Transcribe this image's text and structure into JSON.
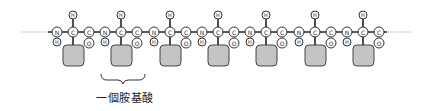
{
  "diagram": {
    "residue_count": 7,
    "atoms": {
      "nitrogen": "N",
      "alpha_carbon": "C",
      "carbonyl_carbon": "C",
      "oxygen": "O",
      "hydrogen": "H"
    },
    "residue_n_x": [
      57,
      105,
      154,
      202,
      250,
      299,
      347
    ],
    "backbone_y": 32,
    "side_chain_color": "#c4c4c4",
    "chain_continues_left": true,
    "chain_continues_right": true,
    "brace_residue_index": 1,
    "label": "一個胺基酸"
  }
}
